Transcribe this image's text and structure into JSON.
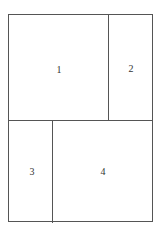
{
  "diagram": {
    "type": "rectangular-partition",
    "line_color": "#555555",
    "text_color": "#333333",
    "regions": [
      {
        "id": "1",
        "label": "1",
        "position": "top-left"
      },
      {
        "id": "2",
        "label": "2",
        "position": "top-right"
      },
      {
        "id": "3",
        "label": "3",
        "position": "bottom-left"
      },
      {
        "id": "4",
        "label": "4",
        "position": "bottom-right"
      }
    ]
  }
}
